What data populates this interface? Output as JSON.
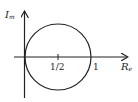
{
  "diagram": {
    "title": "",
    "axes": {
      "vertical_label": "I",
      "vertical_label_sub": "m",
      "horizontal_label": "R",
      "horizontal_label_sub": "e"
    },
    "ticks": {
      "half": "1/2",
      "one": "1"
    },
    "circle": {
      "center_re": 0.5,
      "center_im": 0,
      "radius": 0.5
    },
    "colors": {
      "stroke": "#222222",
      "background": "#ffffff"
    }
  }
}
